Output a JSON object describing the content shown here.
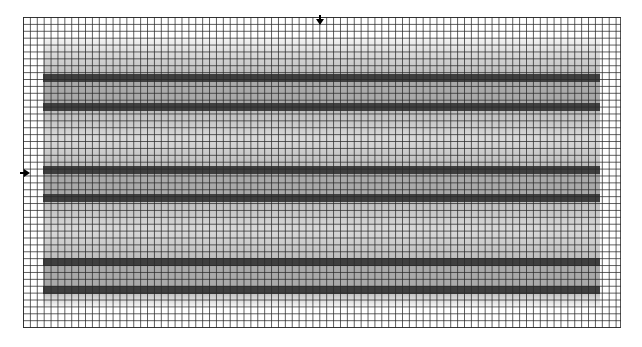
{
  "canvas": {
    "width": 642,
    "height": 347,
    "background": "#ffffff"
  },
  "grid": {
    "left": 23,
    "top": 17,
    "right": 621,
    "bottom": 328,
    "cell_size_px": 6.9,
    "line_color": "#555555"
  },
  "shaded_region": {
    "left": 43,
    "right": 600,
    "top": 38,
    "bottom": 305
  },
  "bands": [
    {
      "id": "band-1",
      "top": 74,
      "height": 8,
      "color": "#3e3e3e"
    },
    {
      "id": "band-2",
      "top": 103,
      "height": 8,
      "color": "#3e3e3e"
    },
    {
      "id": "band-3",
      "top": 166,
      "height": 8,
      "color": "#3e3e3e"
    },
    {
      "id": "band-4",
      "top": 194,
      "height": 8,
      "color": "#3e3e3e"
    },
    {
      "id": "band-5",
      "top": 258,
      "height": 8,
      "color": "#3e3e3e"
    },
    {
      "id": "band-6",
      "top": 286,
      "height": 8,
      "color": "#3e3e3e"
    }
  ],
  "markers": [
    {
      "id": "top-marker",
      "direction": "down",
      "x": 320,
      "y": 22
    },
    {
      "id": "left-marker",
      "direction": "right",
      "x": 26,
      "y": 173
    }
  ]
}
